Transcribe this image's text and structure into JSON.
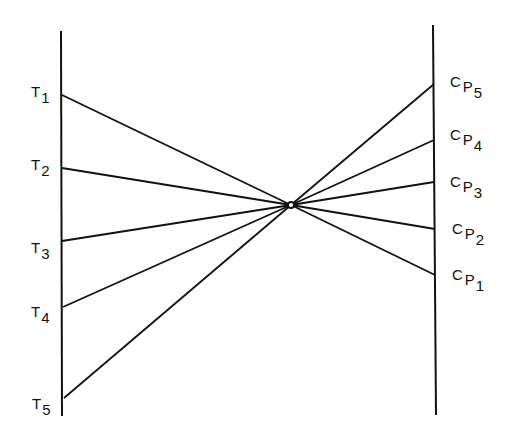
{
  "diagram": {
    "stroke_color": "#111111",
    "background": "#ffffff",
    "left_axis": {
      "x": 61,
      "y_top": 31,
      "y_bottom": 416
    },
    "right_axis": {
      "x": 434,
      "y_top": 25,
      "y_bottom": 415
    },
    "center_node": {
      "x": 291,
      "y": 205,
      "r": 3
    },
    "left_points": [
      {
        "id": "T1",
        "main": "T",
        "sub": "1",
        "x": 62,
        "y": 95
      },
      {
        "id": "T2",
        "main": "T",
        "sub": "2",
        "x": 62,
        "y": 168
      },
      {
        "id": "T3",
        "main": "T",
        "sub": "3",
        "x": 62,
        "y": 241
      },
      {
        "id": "T4",
        "main": "T",
        "sub": "4",
        "x": 63,
        "y": 307
      },
      {
        "id": "T5",
        "main": "T",
        "sub": "5",
        "x": 64,
        "y": 398
      }
    ],
    "right_points": [
      {
        "id": "CP5",
        "c": "C",
        "p": "P",
        "sub": "5",
        "x": 434,
        "y": 84
      },
      {
        "id": "CP4",
        "c": "C",
        "p": "P",
        "sub": "4",
        "x": 434,
        "y": 140
      },
      {
        "id": "CP3",
        "c": "C",
        "p": "P",
        "sub": "3",
        "x": 434,
        "y": 182
      },
      {
        "id": "CP2",
        "c": "C",
        "p": "P",
        "sub": "2",
        "x": 435,
        "y": 229
      },
      {
        "id": "CP1",
        "c": "C",
        "p": "P",
        "sub": "1",
        "x": 435,
        "y": 275
      }
    ]
  },
  "labels": {
    "t1": {
      "main": "T",
      "sub": "1"
    },
    "t2": {
      "main": "T",
      "sub": "2"
    },
    "t3": {
      "main": "T",
      "sub": "3"
    },
    "t4": {
      "main": "T",
      "sub": "4"
    },
    "t5": {
      "main": "T",
      "sub": "5"
    },
    "cp5": {
      "c": "C",
      "p": "P",
      "sub": "5"
    },
    "cp4": {
      "c": "C",
      "p": "P",
      "sub": "4"
    },
    "cp3": {
      "c": "C",
      "p": "P",
      "sub": "3"
    },
    "cp2": {
      "c": "C",
      "p": "P",
      "sub": "2"
    },
    "cp1": {
      "c": "C",
      "p": "P",
      "sub": "1"
    }
  }
}
